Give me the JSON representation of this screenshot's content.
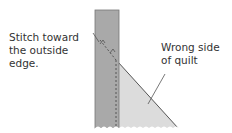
{
  "labels": {
    "stitch": [
      "Stitch toward",
      "the outside",
      "edge."
    ],
    "wrong_side": [
      "Wrong side",
      "of quilt"
    ]
  },
  "colors": {
    "binding_strip": "#a9a9a9",
    "quilt_triangle": "#dcdcdc",
    "outline": "#555555",
    "text": "#333333"
  }
}
